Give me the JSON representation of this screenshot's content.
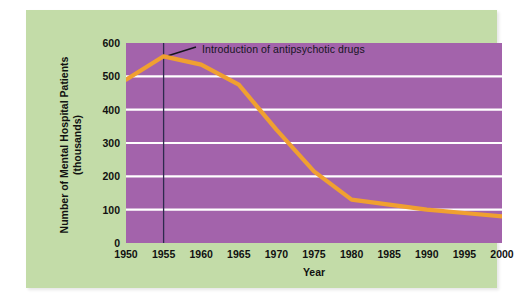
{
  "figure": {
    "panel_color": "#c3dca8",
    "plot_background_color": "#a363ab",
    "gridline_color": "#ffffff",
    "line_color": "#f0a030",
    "marker_line_color": "#2e2a4e"
  },
  "chart_data": {
    "type": "line",
    "title": "",
    "xlabel": "Year",
    "ylabel": "Number of Mental Hospital Patients (thousands)",
    "ylabel_line1": "Number of Mental Hospital Patients",
    "ylabel_line2": "(thousands)",
    "xlim": [
      1950,
      2000
    ],
    "ylim": [
      0,
      600
    ],
    "ytick_labels": [
      "600",
      "500",
      "400",
      "300",
      "200",
      "100",
      "0"
    ],
    "yticks": [
      600,
      500,
      400,
      300,
      200,
      100,
      0
    ],
    "xtick_labels": [
      "1950",
      "1955",
      "1960",
      "1965",
      "1970",
      "1975",
      "1980",
      "1985",
      "1990",
      "1995",
      "2000"
    ],
    "xticks": [
      1950,
      1955,
      1960,
      1965,
      1970,
      1975,
      1980,
      1985,
      1990,
      1995,
      2000
    ],
    "grid": "horizontal",
    "legend": "none",
    "x": [
      1950,
      1955,
      1960,
      1965,
      1970,
      1975,
      1980,
      1985,
      1990,
      1995,
      2000
    ],
    "values": [
      490,
      560,
      535,
      475,
      340,
      215,
      130,
      115,
      100,
      90,
      80
    ],
    "series": [
      {
        "name": "Number of Mental Hospital Patients (thousands)",
        "values": [
          490,
          560,
          535,
          475,
          340,
          215,
          130,
          115,
          100,
          90,
          80
        ]
      }
    ],
    "annotations": [
      {
        "text": "Introduction of antipsychotic drugs",
        "x": 1955,
        "kind": "vertical-marker-with-leader"
      }
    ]
  }
}
